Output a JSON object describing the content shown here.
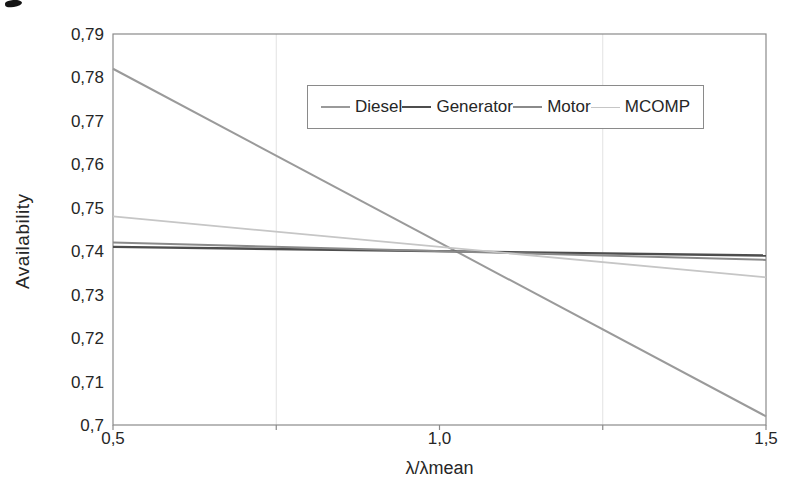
{
  "chart_data": {
    "type": "line",
    "title": "",
    "ylabel": "Availability",
    "xlabel": "λ/λmean",
    "x_range": [
      0.5,
      1.5
    ],
    "y_range": [
      0.7,
      0.79
    ],
    "decimal_separator": ",",
    "y_ticks": [
      {
        "value": 0.7,
        "label": "0,7"
      },
      {
        "value": 0.71,
        "label": "0,71"
      },
      {
        "value": 0.72,
        "label": "0,72"
      },
      {
        "value": 0.73,
        "label": "0,73"
      },
      {
        "value": 0.74,
        "label": "0,74"
      },
      {
        "value": 0.75,
        "label": "0,75"
      },
      {
        "value": 0.76,
        "label": "0,76"
      },
      {
        "value": 0.77,
        "label": "0,77"
      },
      {
        "value": 0.78,
        "label": "0,78"
      },
      {
        "value": 0.79,
        "label": "0,79"
      }
    ],
    "x_ticks": [
      {
        "value": 0.5,
        "label": "0,5"
      },
      {
        "value": 0.75,
        "label": ""
      },
      {
        "value": 1.0,
        "label": "1,0"
      },
      {
        "value": 1.25,
        "label": ""
      },
      {
        "value": 1.5,
        "label": "1,5"
      }
    ],
    "gridlines_x": [
      0.75,
      1.25
    ],
    "grid": "vertical-only-faint",
    "legend_position": "top-center-inside-box",
    "legend_entries": [
      "Diesel",
      "Generator",
      "Motor",
      "MCOMP"
    ],
    "series": [
      {
        "name": "Diesel",
        "color": "#9a9a9a",
        "stroke_width": 2,
        "x": [
          0.5,
          1.5
        ],
        "values": [
          0.782,
          0.702
        ]
      },
      {
        "name": "Generator",
        "color": "#4d4d4d",
        "stroke_width": 2.4,
        "x": [
          0.5,
          1.5
        ],
        "values": [
          0.741,
          0.739
        ]
      },
      {
        "name": "Motor",
        "color": "#8a8a8a",
        "stroke_width": 2,
        "x": [
          0.5,
          1.5
        ],
        "values": [
          0.742,
          0.738
        ]
      },
      {
        "name": "MCOMP",
        "color": "#c6c6c6",
        "stroke_width": 1.8,
        "x": [
          0.5,
          1.5
        ],
        "values": [
          0.748,
          0.734
        ]
      }
    ],
    "colors": {
      "axis": "#8a8a8a",
      "gridline": "#e2e2e2",
      "text": "#262626",
      "background": "#ffffff"
    }
  }
}
